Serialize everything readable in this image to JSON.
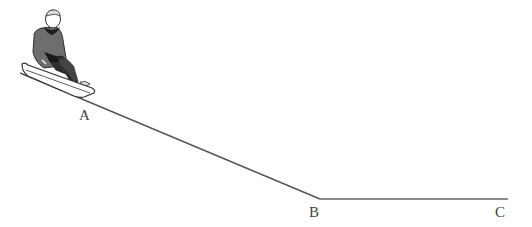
{
  "diagram": {
    "labels": {
      "a": "A",
      "b": "B",
      "c": "C"
    },
    "points": {
      "slope_start": [
        20,
        73
      ],
      "b": [
        320,
        199
      ],
      "c": [
        508,
        199
      ]
    },
    "colors": {
      "line": "#555555",
      "coat": "#6e6e6e",
      "dark": "#2a2a2a",
      "sled": "#ffffff"
    }
  }
}
